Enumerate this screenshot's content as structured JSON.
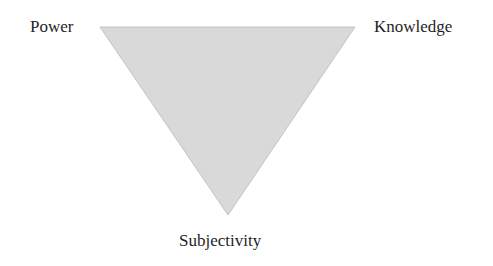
{
  "diagram": {
    "type": "inverted-triangle",
    "vertices": {
      "top_left": {
        "label": "Power"
      },
      "top_right": {
        "label": "Knowledge"
      },
      "bottom": {
        "label": "Subjectivity"
      }
    },
    "colors": {
      "fill": "#d9d9d9",
      "stroke": "#c4c4c4",
      "text": "#1f1f1f"
    }
  }
}
